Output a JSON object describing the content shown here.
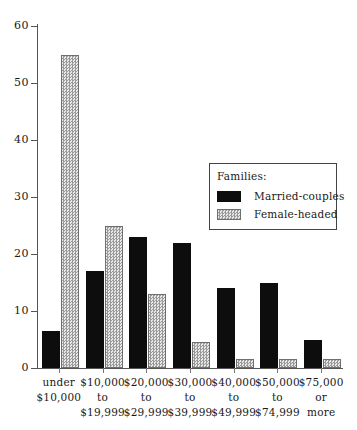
{
  "chart_data": {
    "type": "bar",
    "title": "",
    "subtitle": "",
    "xlabel": "",
    "ylabel": "",
    "ylim": [
      0,
      60
    ],
    "yticks": [
      0,
      10,
      20,
      30,
      40,
      50,
      60
    ],
    "grid": false,
    "legend_position": "inside-right",
    "legend_title": "Families:",
    "categories": [
      [
        "under",
        "$10,000"
      ],
      [
        "$10,000",
        "to",
        "$19,999"
      ],
      [
        "$20,000",
        "to",
        "$29,999"
      ],
      [
        "$30,000",
        "to",
        "$39,999"
      ],
      [
        "$40,000",
        "to",
        "$49,999"
      ],
      [
        "$50,000",
        "to",
        "$74,999"
      ],
      [
        "$75,000",
        "or",
        "more"
      ]
    ],
    "category_labels_flat": [
      "under $10,000",
      "$10,000 to $19,999",
      "$20,000 to $29,999",
      "$30,000 to $39,999",
      "$40,000 to $49,999",
      "$50,000 to $74,999",
      "$75,000 or more"
    ],
    "series": [
      {
        "name": "Married-couples",
        "key": "married",
        "color": "#0d0d0d",
        "values": [
          6.5,
          17,
          23,
          22,
          14,
          15,
          5
        ]
      },
      {
        "name": "Female-headed",
        "key": "female",
        "color": "#9a9a9a",
        "values": [
          55,
          25,
          13,
          4.5,
          1.5,
          1.5,
          1.5
        ]
      }
    ]
  },
  "legend": {
    "title": "Families:",
    "entries": [
      {
        "label": "Married-couples",
        "swatch": "married"
      },
      {
        "label": "Female-headed",
        "swatch": "female"
      }
    ]
  },
  "axis": {
    "y_tick_labels": [
      "60",
      "50",
      "40",
      "30",
      "20",
      "10",
      "0"
    ]
  }
}
